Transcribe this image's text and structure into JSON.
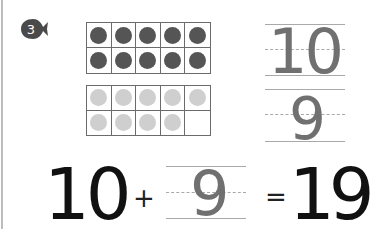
{
  "problem": {
    "number": "3",
    "icon": "fish-badge-icon"
  },
  "ten_frames": {
    "top": {
      "filled": 10,
      "total": 10,
      "dot_color": "#555555"
    },
    "bottom": {
      "filled": 9,
      "total": 10,
      "dot_color": "#cfcfcf"
    }
  },
  "vertical_addends": {
    "first": "10",
    "second": "9"
  },
  "equation": {
    "addend1": "10",
    "plus": "+",
    "addend2": "9",
    "equals": "=",
    "sum": "19"
  },
  "colors": {
    "trace_digit": "#707070",
    "final_digit": "#111111",
    "guide_line": "#a9a9a9"
  }
}
